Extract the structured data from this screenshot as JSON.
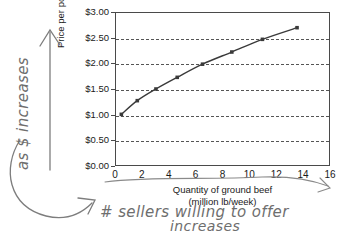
{
  "chart_data": {
    "type": "line",
    "title": "",
    "xlabel": "Quantity of ground beef",
    "xlabel_sub": "(million lb/week)",
    "ylabel": "Price per pound",
    "xlim": [
      0,
      16
    ],
    "ylim": [
      0,
      3.0
    ],
    "grid": true,
    "legend": "none",
    "xticks": [
      "0",
      "2",
      "4",
      "6",
      "8",
      "10",
      "12",
      "14",
      "16"
    ],
    "xtick_values": [
      0,
      2,
      4,
      6,
      8,
      10,
      12,
      14,
      16
    ],
    "yticks": [
      "$0.00",
      "$0.50",
      "$1.00",
      "$1.50",
      "$2.00",
      "$2.50",
      "$3.00"
    ],
    "ytick_values": [
      0,
      0.5,
      1.0,
      1.5,
      2.0,
      2.5,
      3.0
    ],
    "series": [
      {
        "name": "Supply",
        "marker": "square",
        "color": "#3a3a3a",
        "x": [
          0.4,
          1.6,
          3.0,
          4.6,
          6.5,
          8.7,
          11.0,
          13.6
        ],
        "y": [
          1.0,
          1.27,
          1.5,
          1.73,
          1.99,
          2.23,
          2.48,
          2.71
        ]
      }
    ]
  },
  "annotations": {
    "left_note": "as $ increases",
    "bottom_note_line1": "# sellers willing to offer",
    "bottom_note_line2": "increases"
  }
}
